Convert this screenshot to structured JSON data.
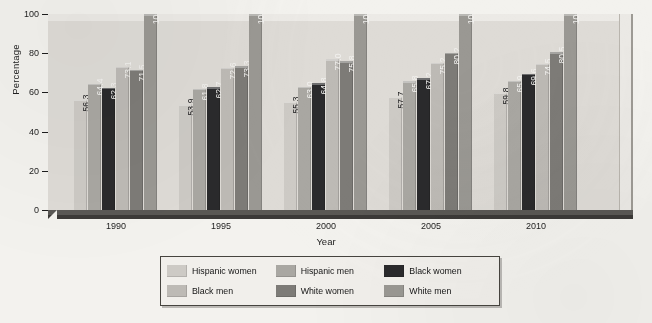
{
  "chart_data": {
    "type": "bar",
    "title": "",
    "xlabel": "Year",
    "ylabel": "Percentage",
    "categories": [
      "1990",
      "1995",
      "2000",
      "2005",
      "2010"
    ],
    "ylim": [
      0,
      100
    ],
    "yticks": [
      "0",
      "20",
      "40",
      "60",
      "80",
      "100"
    ],
    "grid": false,
    "legend_position": "bottom",
    "series": [
      {
        "name": "Hispanic women",
        "color": "#cdcac5",
        "values": [
          56.3,
          53.9,
          55.3,
          57.7,
          59.8
        ]
      },
      {
        "name": "Hispanic men",
        "color": "#a9a7a2",
        "values": [
          64.4,
          61.8,
          63.0,
          65.8,
          65.9
        ]
      },
      {
        "name": "Black women",
        "color": "#2a2a2c",
        "values": [
          62.3,
          62.7,
          64.8,
          67.2,
          69.6
        ]
      },
      {
        "name": "Black men",
        "color": "#bdbab5",
        "values": [
          73.1,
          72.6,
          77.0,
          75.2,
          74.5
        ]
      },
      {
        "name": "White women",
        "color": "#7d7b77",
        "values": [
          71.5,
          73.3,
          75.8,
          80.2,
          80.5
        ]
      },
      {
        "name": "White men",
        "color": "#9a9893",
        "values": [
          100,
          100,
          100,
          100,
          100
        ]
      }
    ],
    "value_labels": {
      "1990": [
        "56.3",
        "64.4",
        "62.3",
        "73.1",
        "71.5",
        "100"
      ],
      "1995": [
        "53.9",
        "61.8",
        "62.7",
        "72.6",
        "73.3",
        "100"
      ],
      "2000": [
        "55.3",
        "63.0",
        "64.8",
        "77.0",
        "75.8",
        "100"
      ],
      "2005": [
        "57.7",
        "65.8",
        "67.2",
        "75.2",
        "80.2",
        "100"
      ],
      "2010": [
        "59.8",
        "65.9",
        "69.6",
        "74.5",
        "80.5",
        "100"
      ]
    }
  },
  "legend": {
    "items": [
      {
        "label": "Hispanic women",
        "color": "#cdcac5"
      },
      {
        "label": "Hispanic men",
        "color": "#a9a7a2"
      },
      {
        "label": "Black women",
        "color": "#2a2a2c"
      },
      {
        "label": "Black men",
        "color": "#bdbab5"
      },
      {
        "label": "White women",
        "color": "#7d7b77"
      },
      {
        "label": "White men",
        "color": "#9a9893"
      }
    ]
  },
  "axes": {
    "y_title": "Percentage",
    "x_title": "Year",
    "y_ticks": [
      "100",
      "80",
      "60",
      "40",
      "20",
      "0"
    ],
    "x_ticks": [
      "1990",
      "1995",
      "2000",
      "2005",
      "2010"
    ]
  },
  "colors": {
    "page_background": "#f3f2ee",
    "plot_background": "#dedbd6",
    "floor": "#4c4a47",
    "legend_border": "#46443f"
  }
}
